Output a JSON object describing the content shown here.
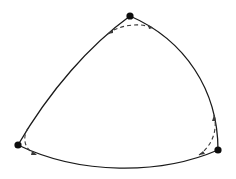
{
  "diagram": {
    "colors": {
      "edge": "#1a1a1a",
      "dashed": "#3a3a3a",
      "vertex": "#0d0d0d",
      "background": "#ffffff"
    },
    "vertices": [
      {
        "id": "top"
      },
      {
        "id": "left"
      },
      {
        "id": "right"
      }
    ],
    "edges": [
      {
        "id": "top-left",
        "from": "top",
        "to": "left",
        "style": "solid"
      },
      {
        "id": "left-right",
        "from": "left",
        "to": "right",
        "style": "solid"
      },
      {
        "id": "right-top",
        "from": "right",
        "to": "top",
        "style": "solid"
      }
    ],
    "corner_curves": [
      {
        "id": "top-corner",
        "vertex": "top",
        "style": "dashed"
      },
      {
        "id": "left-corner",
        "vertex": "left",
        "style": "dashed"
      },
      {
        "id": "right-corner",
        "vertex": "right",
        "style": "dashed"
      }
    ]
  }
}
